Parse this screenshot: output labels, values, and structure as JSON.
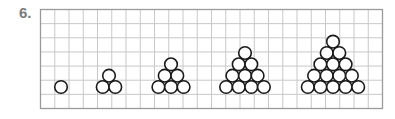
{
  "question": {
    "number": "6."
  },
  "grid": {
    "x": 40.5,
    "y": 9.5,
    "width": 342,
    "height": 99,
    "cols": 24,
    "rows": 7,
    "line_color": "#c8c8c8",
    "border_color": "#9a9a9a"
  },
  "circle_style": {
    "radius": 6.3,
    "stroke": "#1a1a1a",
    "stroke_width": 1.6
  },
  "figures": [
    {
      "label": "figure-1",
      "rows": 1,
      "center_x": 61,
      "base_y": 87
    },
    {
      "label": "figure-2",
      "rows": 2,
      "center_x": 109,
      "base_y": 87
    },
    {
      "label": "figure-3",
      "rows": 3,
      "center_x": 171,
      "base_y": 87
    },
    {
      "label": "figure-4",
      "rows": 4,
      "center_x": 245,
      "base_y": 87
    },
    {
      "label": "figure-5",
      "rows": 5,
      "center_x": 333,
      "base_y": 87
    }
  ]
}
